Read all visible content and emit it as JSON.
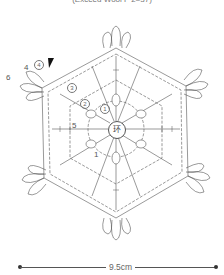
{
  "caption": "(Exceed Wool F 2=37)",
  "center_label": "环",
  "labels": {
    "row4_plain": "4",
    "row4_circled": "4",
    "row6_plain": "6",
    "row3_circled": "3",
    "row2_circled": "2",
    "row1_circled": "1",
    "row5_plain": "5",
    "row1_plain": "1"
  },
  "start_marker": "start-triangle",
  "measurement": "9.5cm",
  "colors": {
    "line": "#555555",
    "text": "#666666",
    "background": "#ffffff"
  }
}
